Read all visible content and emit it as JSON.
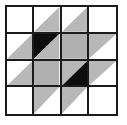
{
  "figure": {
    "name": "quilt-block-pattern",
    "type": "geometric-quilt-block",
    "grid_rows": 4,
    "grid_columns": 4,
    "colors": {
      "background": "#ffffff",
      "line": "#1b1b1b",
      "solid_black": "#0d0d0d",
      "solid_gray": "#b8b8b8",
      "hatch_light": "#ffffff",
      "hatch_dark": "#4a4a4a"
    },
    "border_width_px": 2,
    "cells": [
      {
        "row": 0,
        "col": 0,
        "fill": "empty",
        "shape": "none",
        "label": "white square"
      },
      {
        "row": 0,
        "col": 1,
        "fill": "gray",
        "shape": "triangle-bottom-right",
        "label": "gray lower-right triangle"
      },
      {
        "row": 0,
        "col": 2,
        "fill": "gray",
        "shape": "triangle-bottom-right",
        "label": "gray lower-right triangle"
      },
      {
        "row": 0,
        "col": 3,
        "fill": "empty",
        "shape": "none",
        "label": "white square"
      },
      {
        "row": 1,
        "col": 0,
        "fill": "gray",
        "shape": "triangle-bottom-right",
        "label": "gray lower-right triangle"
      },
      {
        "row": 1,
        "col": 1,
        "fill": "black-gray",
        "shape": "split-diagonal-tlbr",
        "label": "black upper-left and gray lower-right triangles"
      },
      {
        "row": 1,
        "col": 2,
        "fill": "hatch",
        "shape": "full-square",
        "label": "hatched square"
      },
      {
        "row": 1,
        "col": 3,
        "fill": "gray",
        "shape": "triangle-top-left",
        "label": "gray upper-left triangle"
      },
      {
        "row": 2,
        "col": 0,
        "fill": "gray",
        "shape": "triangle-bottom-right",
        "label": "gray lower-right triangle"
      },
      {
        "row": 2,
        "col": 1,
        "fill": "hatch",
        "shape": "full-square",
        "label": "hatched square"
      },
      {
        "row": 2,
        "col": 2,
        "fill": "gray-black",
        "shape": "split-diagonal-tlbr",
        "label": "gray upper-left and black lower-right triangles"
      },
      {
        "row": 2,
        "col": 3,
        "fill": "gray",
        "shape": "triangle-top-left",
        "label": "gray upper-left triangle"
      },
      {
        "row": 3,
        "col": 0,
        "fill": "empty",
        "shape": "none",
        "label": "white square"
      },
      {
        "row": 3,
        "col": 1,
        "fill": "gray",
        "shape": "triangle-top-left",
        "label": "gray upper-left triangle"
      },
      {
        "row": 3,
        "col": 2,
        "fill": "gray",
        "shape": "triangle-top-left",
        "label": "gray upper-left triangle"
      },
      {
        "row": 3,
        "col": 3,
        "fill": "empty",
        "shape": "none",
        "label": "white square"
      }
    ]
  }
}
